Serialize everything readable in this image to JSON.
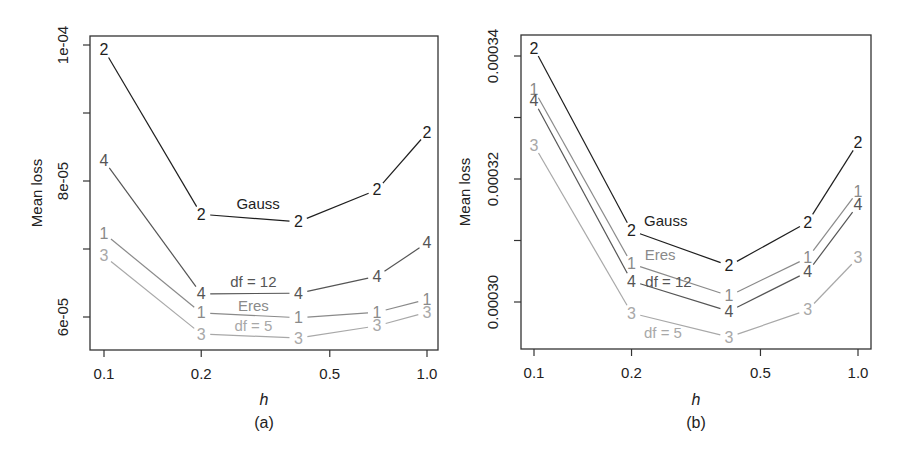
{
  "chart_data": [
    {
      "type": "line",
      "panel_label": "(a)",
      "title": "",
      "xlabel": "h",
      "ylabel": "Mean loss",
      "xscale": "log",
      "x_ticks": [
        0.1,
        0.2,
        0.5,
        1.0
      ],
      "x_tick_labels": [
        "0.1",
        "0.2",
        "0.5",
        "1.0"
      ],
      "y_ticks": [
        6e-05,
        7e-05,
        8e-05,
        9e-05,
        0.0001
      ],
      "y_tick_labels": [
        "6e-05",
        "",
        "8e-05",
        "",
        "1e-04"
      ],
      "ylim": [
        5.45e-05,
        0.0001013
      ],
      "xlim": [
        0.092,
        1.12
      ],
      "grid": false,
      "x": [
        0.1,
        0.2,
        0.4,
        0.7,
        1.0
      ],
      "series": [
        {
          "id": "2",
          "name": "Gauss",
          "color": "#1e1e1e",
          "values": [
            9.93e-05,
            7.51e-05,
            7.4e-05,
            7.87e-05,
            8.71e-05
          ]
        },
        {
          "id": "4",
          "name": "df = 12",
          "color": "#555555",
          "values": [
            8.3e-05,
            6.34e-05,
            6.35e-05,
            6.6e-05,
            7.09e-05
          ]
        },
        {
          "id": "1",
          "name": "Eres",
          "color": "#8a8a8a",
          "values": [
            7.23e-05,
            6.06e-05,
            5.99e-05,
            6.07e-05,
            6.26e-05
          ]
        },
        {
          "id": "3",
          "name": "df = 5",
          "color": "#a8a8a8",
          "values": [
            6.9e-05,
            5.75e-05,
            5.69e-05,
            5.87e-05,
            6.07e-05
          ]
        }
      ],
      "annotations": [
        {
          "text": "Gauss",
          "series": "2",
          "x": 0.3,
          "y": 7.67e-05
        },
        {
          "text": "df = 12",
          "series": "4",
          "x": 0.29,
          "y": 6.52e-05
        },
        {
          "text": "Eres",
          "series": "1",
          "x": 0.29,
          "y": 6.17e-05
        },
        {
          "text": "df = 5",
          "series": "3",
          "x": 0.29,
          "y": 5.87e-05
        }
      ]
    },
    {
      "type": "line",
      "panel_label": "(b)",
      "title": "",
      "xlabel": "h",
      "ylabel": "Mean loss",
      "xscale": "log",
      "x_ticks": [
        0.1,
        0.2,
        0.5,
        1.0
      ],
      "x_tick_labels": [
        "0.1",
        "0.2",
        "0.5",
        "1.0"
      ],
      "y_ticks": [
        0.0003,
        0.00031,
        0.00032,
        0.00033,
        0.00034
      ],
      "y_tick_labels": [
        "0.00030",
        "",
        "0.00032",
        "",
        "0.00034"
      ],
      "ylim": [
        0.0002925,
        0.0003435
      ],
      "xlim": [
        0.092,
        1.12
      ],
      "grid": false,
      "x": [
        0.1,
        0.2,
        0.4,
        0.7,
        1.0
      ],
      "series": [
        {
          "id": "2",
          "name": "Gauss",
          "color": "#1e1e1e",
          "values": [
            0.0003413,
            0.0003116,
            0.0003059,
            0.000313,
            0.0003259
          ]
        },
        {
          "id": "1",
          "name": "Eres",
          "color": "#8a8a8a",
          "values": [
            0.0003345,
            0.0003062,
            0.000301,
            0.0003072,
            0.000318
          ]
        },
        {
          "id": "4",
          "name": "df = 12",
          "color": "#555555",
          "values": [
            0.0003327,
            0.0003034,
            0.0002985,
            0.0003049,
            0.0003158
          ]
        },
        {
          "id": "3",
          "name": "df = 5",
          "color": "#a8a8a8",
          "values": [
            0.0003255,
            0.0002982,
            0.0002943,
            0.0002987,
            0.0003072
          ]
        }
      ],
      "annotations": [
        {
          "text": "Gauss",
          "series": "2",
          "x": 0.255,
          "y": 0.0003132
        },
        {
          "text": "Eres",
          "series": "1",
          "x": 0.245,
          "y": 0.0003078
        },
        {
          "text": "df = 12",
          "series": "4",
          "x": 0.26,
          "y": 0.0003034
        },
        {
          "text": "df = 5",
          "series": "3",
          "x": 0.25,
          "y": 0.000295
        }
      ]
    }
  ],
  "panels": [
    {
      "box": {
        "left": 90,
        "top": 36,
        "right": 438,
        "bottom": 350
      },
      "px_map": {
        "x_at_0_1": 104,
        "x_at_1_0": 427,
        "y_top_val": 0.0001,
        "y_top_px": 45,
        "y_bot_val": 6e-05,
        "y_bot_px": 317
      },
      "ylabel_x": 42,
      "ticklabel_x": 68,
      "caption_y": 428,
      "xlabel_y": 405
    },
    {
      "box": {
        "left": 521,
        "top": 35,
        "right": 871,
        "bottom": 349
      },
      "px_map": {
        "x_at_0_1": 534,
        "x_at_1_0": 858,
        "y_top_val": 0.00034,
        "y_top_px": 56,
        "y_bot_val": 0.0003,
        "y_bot_px": 302
      },
      "ylabel_x": 470,
      "ticklabel_x": 498,
      "caption_y": 428,
      "xlabel_y": 405
    }
  ]
}
